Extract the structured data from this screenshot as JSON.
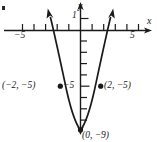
{
  "figure": {
    "kind": "coordinate-graph",
    "ink_color": "#1a1a1a",
    "background_color": "#ffffff"
  },
  "axes": {
    "x_axis_label": "x",
    "y_axis_label": "y",
    "x_ticks_labeled": [
      {
        "value": -5,
        "text": "−5"
      },
      {
        "value": 5,
        "text": "5"
      }
    ],
    "y_ticks_labeled": [
      {
        "value": 1,
        "text": "1"
      },
      {
        "value": -5,
        "text": "−5"
      }
    ],
    "x_range": [
      -7,
      7
    ],
    "y_range": [
      -10,
      2
    ],
    "grid": false,
    "arrowheads": [
      "x-positive",
      "y-negative-lower",
      "y-positive-upper"
    ]
  },
  "curve": {
    "type": "parabola",
    "equation": "y = x² − 9",
    "opens": "up",
    "vertex": {
      "x": 0,
      "y": -9
    },
    "arrowheads_on_ends": true
  },
  "points": [
    {
      "id": "left-point",
      "x": -2,
      "y": -5,
      "label": "(−2, −5)",
      "label_side": "left"
    },
    {
      "id": "right-point",
      "x": 2,
      "y": -5,
      "label": "(2, −5)",
      "label_side": "right"
    },
    {
      "id": "vertex-point",
      "x": 0,
      "y": -9,
      "label": "(0, −9)",
      "label_side": "right"
    }
  ],
  "marks": {
    "corner_bullet": "▪"
  }
}
